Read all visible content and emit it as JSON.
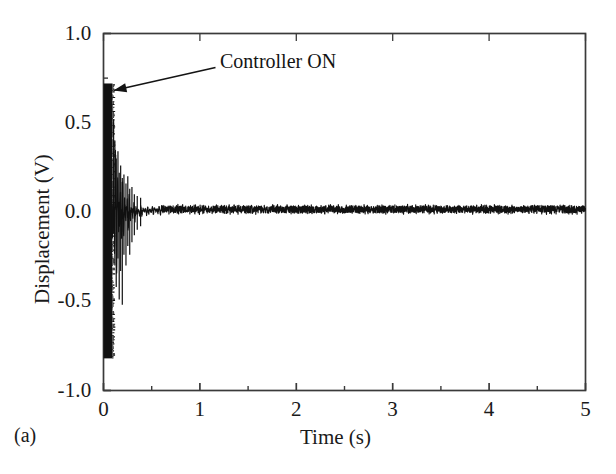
{
  "figure": {
    "panel_label": "(a)",
    "background_color": "#ffffff",
    "line_color": "#111111",
    "axis_color": "#3a3a3a"
  },
  "chart_data": {
    "type": "line",
    "title": "",
    "subtitle": "",
    "xlabel": "Time (s)",
    "ylabel": "Displacement (V)",
    "xlim": [
      0,
      5
    ],
    "ylim": [
      -1.0,
      1.0
    ],
    "x_ticks": [
      0,
      1,
      2,
      3,
      4,
      5
    ],
    "x_tick_labels": [
      "0",
      "1",
      "2",
      "3",
      "4",
      "5"
    ],
    "x_minor_tick_interval": 0.5,
    "y_ticks": [
      -1.0,
      -0.5,
      0.0,
      0.5,
      1.0
    ],
    "y_tick_labels": [
      "-1.0",
      "-0.5",
      "0.0",
      "0.5",
      "1.0"
    ],
    "y_minor_tick_interval": 0.25,
    "grid": false,
    "legend": null,
    "legend_position": "none",
    "frame": "box",
    "annotations": [
      {
        "text": "Controller ON",
        "text_x": 0.64,
        "text_y": 0.8,
        "arrow_tail_x": 0.6,
        "arrow_tail_y": 0.72,
        "arrow_head_x": 0.1,
        "arrow_head_y": 0.62,
        "arrow_style": "single-headed"
      }
    ],
    "series": [
      {
        "name": "Displacement",
        "description": "Free vibration at saturated amplitude until controller switched on at t~0.09 s, then rapid exponential decay to residual sensor noise.",
        "segments": [
          {
            "phase": "uncontrolled-saturated",
            "t_start": 0.0,
            "t_end": 0.09,
            "envelope_upper": 0.72,
            "envelope_lower": -0.82,
            "oscillation_hz": 300,
            "appearance": "solid dark band"
          },
          {
            "phase": "controlled-decay",
            "t_start": 0.09,
            "t_end": 0.6,
            "envelope_start_upper": 0.55,
            "envelope_start_lower": -0.52,
            "envelope_end_upper": 0.035,
            "envelope_end_lower": -0.035,
            "decay_rate_per_s": 9.5,
            "oscillation_hz": 42
          },
          {
            "phase": "settled-noise",
            "t_start": 0.6,
            "t_end": 5.0,
            "envelope_upper": 0.035,
            "envelope_lower": -0.02,
            "mean_offset": 0.015,
            "oscillation_hz": 60
          }
        ],
        "key_points": [
          {
            "t": 0.0,
            "y_max": 0.72,
            "y_min": -0.82
          },
          {
            "t": 0.05,
            "y_max": 0.72,
            "y_min": -0.82
          },
          {
            "t": 0.09,
            "y_max": 0.72,
            "y_min": -0.82
          },
          {
            "t": 0.12,
            "y_max": 0.5,
            "y_min": -0.3
          },
          {
            "t": 0.16,
            "y_max": 0.33,
            "y_min": -0.45
          },
          {
            "t": 0.2,
            "y_max": 0.22,
            "y_min": -0.52
          },
          {
            "t": 0.25,
            "y_max": 0.2,
            "y_min": -0.3
          },
          {
            "t": 0.3,
            "y_max": 0.14,
            "y_min": -0.22
          },
          {
            "t": 0.38,
            "y_max": 0.09,
            "y_min": -0.11
          },
          {
            "t": 0.48,
            "y_max": 0.06,
            "y_min": -0.06
          },
          {
            "t": 0.6,
            "y_max": 0.04,
            "y_min": -0.035
          },
          {
            "t": 1.0,
            "y_max": 0.035,
            "y_min": -0.02
          },
          {
            "t": 2.0,
            "y_max": 0.03,
            "y_min": -0.02
          },
          {
            "t": 3.0,
            "y_max": 0.035,
            "y_min": -0.02
          },
          {
            "t": 4.0,
            "y_max": 0.03,
            "y_min": -0.02
          },
          {
            "t": 5.0,
            "y_max": 0.03,
            "y_min": -0.02
          }
        ]
      }
    ]
  }
}
